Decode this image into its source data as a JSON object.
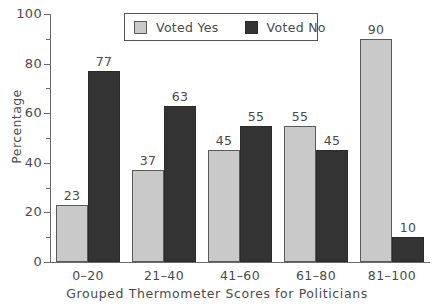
{
  "chart_data": {
    "type": "bar",
    "title": "",
    "xlabel": "Grouped Thermometer Scores for Politicians",
    "ylabel": "Percentage",
    "categories": [
      "0–20",
      "21–40",
      "41–60",
      "61–80",
      "81–100"
    ],
    "series": [
      {
        "name": "Voted Yes",
        "color": "#c9c9c9",
        "values": [
          23,
          37,
          45,
          55,
          90
        ]
      },
      {
        "name": "Voted No",
        "color": "#333333",
        "values": [
          77,
          63,
          55,
          45,
          10
        ]
      }
    ],
    "ylim": [
      0,
      100
    ],
    "y_ticks_major": [
      0,
      20,
      40,
      60,
      80,
      100
    ],
    "y_ticks_minor": [
      10,
      30,
      50,
      70,
      90
    ],
    "grid": false,
    "legend_position": "top-center"
  },
  "legend": {
    "entries": [
      {
        "label": "Voted Yes"
      },
      {
        "label": "Voted No"
      }
    ]
  },
  "axes": {
    "y_tick_labels": [
      "0",
      "20",
      "40",
      "60",
      "80",
      "100"
    ],
    "x_tick_labels": [
      "0–20",
      "21–40",
      "41–60",
      "61–80",
      "81–100"
    ],
    "y_axis_title": "Percentage",
    "x_axis_title": "Grouped Thermometer Scores for Politicians"
  },
  "bar_labels": {
    "g0": {
      "yes": "23",
      "no": "77"
    },
    "g1": {
      "yes": "37",
      "no": "63"
    },
    "g2": {
      "yes": "45",
      "no": "55"
    },
    "g3": {
      "yes": "55",
      "no": "45"
    },
    "g4": {
      "yes": "90",
      "no": "10"
    }
  }
}
